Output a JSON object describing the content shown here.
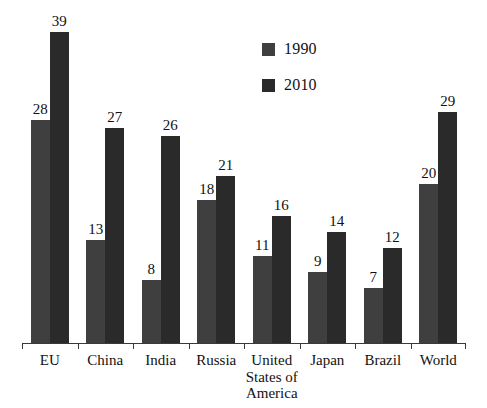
{
  "chart_data": {
    "type": "bar",
    "title": "",
    "subtitle": "",
    "xlabel": "",
    "ylabel": "",
    "ylim": [
      0,
      41
    ],
    "grid": false,
    "legend_position": "top-center",
    "categories": [
      "EU",
      "China",
      "India",
      "Russia",
      "United States of America",
      "Japan",
      "Brazil",
      "World"
    ],
    "category_lines": [
      [
        "EU"
      ],
      [
        "China"
      ],
      [
        "India"
      ],
      [
        "Russia"
      ],
      [
        "United",
        "States of",
        "America"
      ],
      [
        "Japan"
      ],
      [
        "Brazil"
      ],
      [
        "World"
      ]
    ],
    "series": [
      {
        "name": "1990",
        "color": "#3f3f3f",
        "values": [
          28,
          13,
          8,
          18,
          11,
          9,
          7,
          20
        ]
      },
      {
        "name": "2010",
        "color": "#2a2a2a",
        "values": [
          39,
          27,
          26,
          21,
          16,
          14,
          12,
          29
        ]
      }
    ]
  },
  "legend": {
    "entries": [
      {
        "label": "1990",
        "color": "#3f3f3f"
      },
      {
        "label": "2010",
        "color": "#2a2a2a"
      }
    ]
  },
  "axis": {
    "line_color": "#3a3a3a",
    "tick_count": 9
  }
}
